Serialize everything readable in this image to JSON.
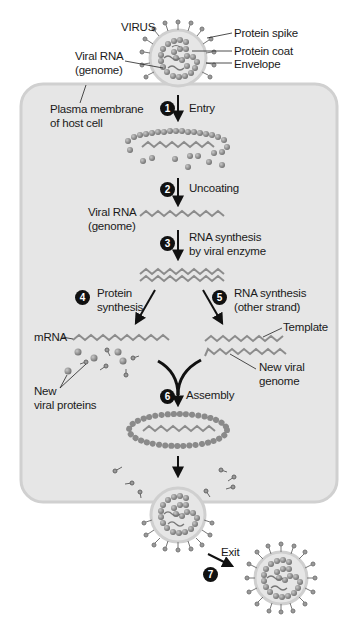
{
  "figure": {
    "title": "VIRUS",
    "virus_labels": {
      "protein_spike": "Protein spike",
      "protein_coat": "Protein coat",
      "envelope": "Envelope",
      "viral_rna_line1": "Viral RNA",
      "viral_rna_line2": "(genome)"
    },
    "cell_label": {
      "line1": "Plasma membrane",
      "line2": "of host cell"
    },
    "steps": [
      {
        "number": "1",
        "label_line1": "Entry",
        "label_line2": ""
      },
      {
        "number": "2",
        "label_line1": "Uncoating",
        "label_line2": ""
      },
      {
        "number": "3",
        "label_line1": "RNA synthesis",
        "label_line2": "by viral enzyme"
      },
      {
        "number": "4",
        "label_line1": "Protein",
        "label_line2": "synthesis"
      },
      {
        "number": "5",
        "label_line1": "RNA synthesis",
        "label_line2": "(other strand)"
      },
      {
        "number": "6",
        "label_line1": "Assembly",
        "label_line2": ""
      },
      {
        "number": "7",
        "label_line1": "Exit",
        "label_line2": ""
      }
    ],
    "intermediate_labels": {
      "viral_rna_line1": "Viral RNA",
      "viral_rna_line2": "(genome)",
      "mrna": "mRNA",
      "template": "Template",
      "new_viral_genome_line1": "New viral",
      "new_viral_genome_line2": "genome",
      "new_viral_proteins_line1": "New",
      "new_viral_proteins_line2": "viral proteins"
    },
    "colors": {
      "cell_fill": "#e6e6e6",
      "cell_border": "#cfcfcf",
      "protein_bead": "#8a8a8a",
      "rna_strand": "#8c8c8c",
      "arrow": "#111111"
    }
  }
}
